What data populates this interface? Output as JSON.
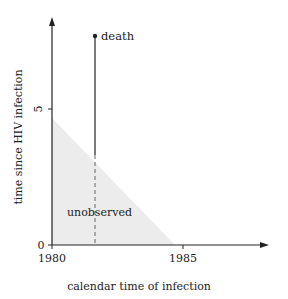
{
  "diagram": {
    "type": "lexis-diagram",
    "xlabel": "calendar time of infection",
    "ylabel": "time since HIV infection",
    "x_ticks": [
      {
        "label": "1980",
        "value": 1980
      },
      {
        "label": "1985",
        "value": 1985
      }
    ],
    "y_ticks": [
      {
        "label": "0",
        "value": 0
      },
      {
        "label": "5",
        "value": 5
      }
    ],
    "region_label": "unobserved",
    "event_label": "death",
    "colors": {
      "axis": "#222222",
      "shade": "#ececec",
      "text": "#222222"
    }
  }
}
